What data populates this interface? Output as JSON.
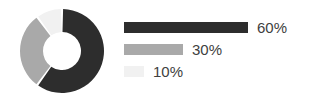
{
  "chart_data": {
    "type": "pie",
    "variant": "donut",
    "title": "",
    "subtitle": "",
    "xlabel": "",
    "ylabel": "",
    "legend_position": "right",
    "grid": false,
    "categories": [
      "60%",
      "30%",
      "10%"
    ],
    "values": [
      60,
      30,
      10
    ],
    "labels": [
      "60%",
      "30%",
      "10%"
    ],
    "colors": [
      "#2d2d2d",
      "#a9a9a9",
      "#f1f1f1"
    ],
    "slices": [
      {
        "label": "60%",
        "value": 60,
        "color": "#2d2d2d",
        "start_angle": 0,
        "end_angle": 216
      },
      {
        "label": "30%",
        "value": 30,
        "color": "#a9a9a9",
        "start_angle": 216,
        "end_angle": 324
      },
      {
        "label": "10%",
        "value": 10,
        "color": "#f1f1f1",
        "start_angle": 324,
        "end_angle": 360
      }
    ],
    "legend_bars": [
      {
        "label": "60%",
        "value": 60,
        "color": "#2d2d2d",
        "bar_width_px": 124
      },
      {
        "label": "30%",
        "value": 30,
        "color": "#a9a9a9",
        "bar_width_px": 59
      },
      {
        "label": "10%",
        "value": 10,
        "color": "#f1f1f1",
        "bar_width_px": 20
      }
    ],
    "total": 100,
    "units": "percent",
    "background_color": "#ffffff",
    "label_color": "#404040"
  },
  "donut": {
    "center_x": 42,
    "center_y": 42,
    "outer_radius": 42,
    "inner_radius": 19,
    "gap_degrees": 3,
    "rotation_start": -90
  },
  "legend": {
    "rows": [
      {
        "label": "60%",
        "color": "#2d2d2d",
        "width": "124px"
      },
      {
        "label": "30%",
        "color": "#a9a9a9",
        "width": "59px"
      },
      {
        "label": "10%",
        "color": "#f1f1f1",
        "width": "20px"
      }
    ]
  }
}
